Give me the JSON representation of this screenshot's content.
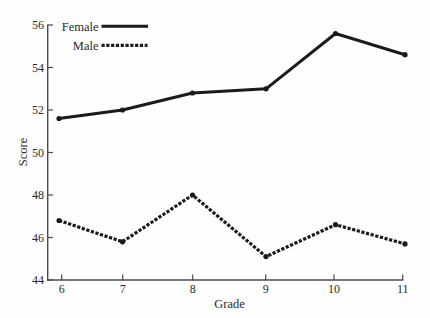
{
  "chart_data": {
    "type": "line",
    "title": "",
    "xlabel": "Grade",
    "ylabel": "Score",
    "categories": [
      "6",
      "7",
      "8",
      "9",
      "10",
      "11"
    ],
    "x": [
      6,
      7,
      8,
      9,
      10,
      11
    ],
    "series": [
      {
        "name": "Female",
        "style": "solid",
        "values": [
          51.6,
          52.0,
          52.8,
          53.0,
          55.6,
          54.6
        ]
      },
      {
        "name": "Male",
        "style": "dotted",
        "values": [
          46.8,
          45.8,
          48.0,
          45.1,
          46.6,
          45.7
        ]
      }
    ],
    "ylim": [
      44,
      56
    ],
    "yticks": [
      "44",
      "46",
      "48",
      "50",
      "52",
      "54",
      "56"
    ],
    "xticks": [
      "6",
      "7",
      "8",
      "9",
      "10",
      "11"
    ],
    "grid": false,
    "legend_position": "top-left",
    "colors": {
      "line": "#1b1b1b",
      "axis": "#4a4a4a",
      "text": "#2a2a2a",
      "background": "#fefefe"
    }
  },
  "legend": {
    "female_label": "Female",
    "male_label": "Male"
  },
  "axes": {
    "x_title": "Grade",
    "y_title": "Score"
  }
}
